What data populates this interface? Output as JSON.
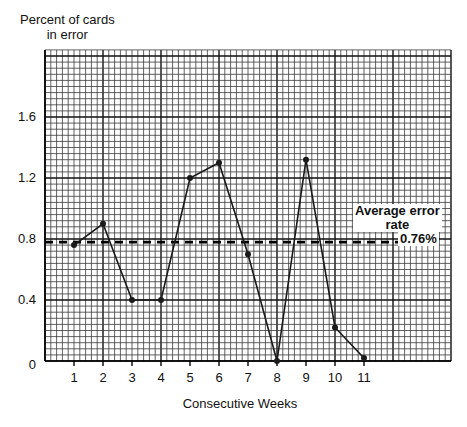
{
  "chart_data": {
    "type": "line",
    "title": "",
    "ylabel": [
      "Percent of cards",
      "in error"
    ],
    "xlabel": "Consecutive Weeks",
    "categories": [
      "1",
      "2",
      "3",
      "4",
      "5",
      "6",
      "7",
      "8",
      "9",
      "10",
      "11"
    ],
    "x": [
      1,
      2,
      3,
      4,
      5,
      6,
      7,
      8,
      9,
      10,
      11
    ],
    "series": [
      {
        "name": "Percent of cards in error",
        "values": [
          0.76,
          0.9,
          0.4,
          0.4,
          1.2,
          1.3,
          0.7,
          0.0,
          1.32,
          0.22,
          0.02
        ]
      }
    ],
    "reference_lines": [
      {
        "name": "Average error rate",
        "value": 0.76,
        "label": "0.76%",
        "style": "dashed"
      }
    ],
    "yticks": [
      "0",
      "0.4",
      "0.8",
      "1.2",
      "1.6"
    ],
    "ytick_values": [
      0,
      0.4,
      0.8,
      1.2,
      1.6
    ],
    "ylim": [
      0,
      2.05
    ],
    "xlim": [
      0,
      14
    ],
    "grid": true,
    "grid_style": "graph paper (minor 0.04 units vertically, 0.2 weeks horizontally)",
    "legend_position": "right, inline annotation"
  },
  "annotation": {
    "title_line1": "Average error",
    "title_line2": "rate",
    "value": "0.76%"
  },
  "colors": {
    "line": "#1a1a1a",
    "grid_minor": "#3a3a3a",
    "grid_major": "#111111",
    "background": "#ffffff"
  }
}
